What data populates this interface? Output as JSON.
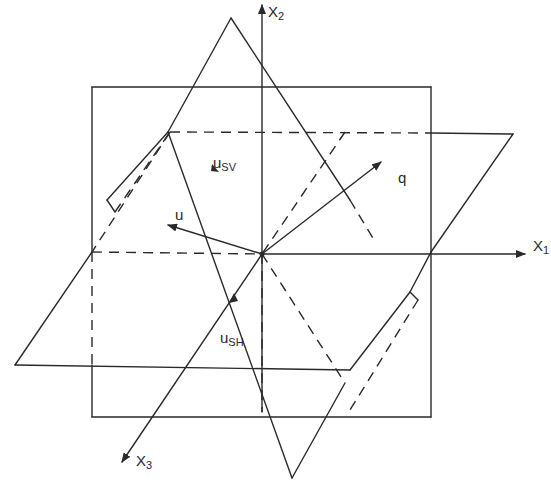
{
  "figure": {
    "type": "3D coordinate geometry diagram (wave vector and polarization planes)",
    "colors": {
      "line": "#2a2a2a",
      "background": "#ffffff"
    }
  },
  "axes": {
    "x1": {
      "label": "X",
      "sub": "1"
    },
    "x2": {
      "label": "X",
      "sub": "2"
    },
    "x3": {
      "label": "X",
      "sub": "3"
    }
  },
  "vectors": {
    "q": {
      "label": "q"
    },
    "u": {
      "label": "u"
    },
    "u_sv": {
      "label": "u",
      "sub": "SV"
    },
    "u_sh": {
      "label": "u",
      "sub": "SH"
    }
  }
}
